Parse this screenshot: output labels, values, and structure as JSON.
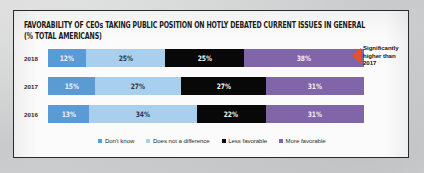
{
  "title": {
    "line1": "FAVORABILITY OF CEOs TAKING PUBLIC POSITION ON HOTLY DEBATED CURRENT ISSUES IN GENERAL",
    "line2": "(% TOTAL AMERICANS)"
  },
  "callout": {
    "text": "Significantly higher than 2017",
    "arrow_color": "#e8502a"
  },
  "chart_data": {
    "type": "bar",
    "orientation": "horizontal",
    "stacked": true,
    "normalized_percent": true,
    "title": "FAVORABILITY OF CEOs TAKING PUBLIC POSITION ON HOTLY DEBATED CURRENT ISSUES IN GENERAL (% TOTAL AMERICANS)",
    "xlabel": "",
    "ylabel": "",
    "xlim": [
      0,
      100
    ],
    "grid": false,
    "legend_position": "bottom",
    "categories": [
      "2018",
      "2017",
      "2016"
    ],
    "series": [
      {
        "name": "Don't know",
        "color": "#5b9bd5",
        "values": [
          12,
          15,
          13
        ],
        "labels": [
          "12%",
          "15%",
          "13%"
        ]
      },
      {
        "name": "Does not a difference",
        "color": "#a9cfee",
        "values": [
          25,
          27,
          34
        ],
        "labels": [
          "25%",
          "27%",
          "34%"
        ]
      },
      {
        "name": "Less favorable",
        "color": "#080808",
        "values": [
          25,
          27,
          22
        ],
        "labels": [
          "25%",
          "27%",
          "22%"
        ]
      },
      {
        "name": "More favorable",
        "color": "#8065a8",
        "values": [
          38,
          31,
          31
        ],
        "labels": [
          "38%",
          "31%",
          "31%"
        ]
      }
    ],
    "annotations": [
      {
        "text": "Significantly higher than 2017",
        "target_category": "2018",
        "target_series": "More favorable"
      }
    ]
  }
}
